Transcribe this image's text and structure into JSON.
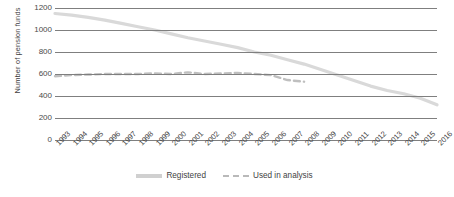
{
  "chart_data": {
    "type": "line",
    "title": "",
    "xlabel": "",
    "ylabel": "Number of pension funds",
    "ylim": [
      0,
      1200
    ],
    "ytick_step": 200,
    "yticks": [
      1200,
      1000,
      800,
      600,
      400,
      200,
      0
    ],
    "grid": true,
    "legend_position": "bottom-center",
    "categories": [
      "1993",
      "1994",
      "1995",
      "1996",
      "1997",
      "1998",
      "1999",
      "2000",
      "2001",
      "2002",
      "2003",
      "2004",
      "2005",
      "2006",
      "2007",
      "2008",
      "2009",
      "2010",
      "2011",
      "2012",
      "2013",
      "2014",
      "2015",
      "2016"
    ],
    "series": [
      {
        "name": "Registered",
        "style": "solid",
        "color": "#d9d9d9",
        "values": [
          1150,
          1135,
          1115,
          1090,
          1060,
          1030,
          1000,
          965,
          930,
          900,
          870,
          840,
          800,
          770,
          730,
          690,
          640,
          590,
          540,
          490,
          450,
          420,
          380,
          320
        ]
      },
      {
        "name": "Used in analysis",
        "style": "dashed",
        "color": "#bfbfbf",
        "values": [
          580,
          590,
          595,
          600,
          600,
          600,
          605,
          600,
          615,
          600,
          605,
          610,
          600,
          590,
          545,
          530,
          null,
          null,
          null,
          null,
          null,
          null,
          null,
          null
        ]
      }
    ]
  },
  "legend": {
    "items": [
      {
        "label": "Registered",
        "style": "solid"
      },
      {
        "label": "Used in analysis",
        "style": "dashed"
      }
    ]
  }
}
